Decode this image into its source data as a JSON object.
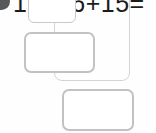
{
  "page": {
    "title": "17+16+15=",
    "background_color": "#fefefe"
  },
  "marker": {
    "name": "bullet-marker",
    "icon": "filled-circle-icon",
    "color": "#585858"
  },
  "equation": {
    "text": "17+16+15=",
    "operands": [
      17,
      16,
      15
    ],
    "operator": "+",
    "equals_sign": "=",
    "text_color": "#1c1c1c"
  },
  "answer_boxes": [
    {
      "id": "answer-box-1",
      "value": "",
      "placeholder": "",
      "border_color": "#c9c9c9",
      "fill_color": "#ffffff"
    },
    {
      "id": "answer-box-2",
      "value": "",
      "placeholder": "",
      "border_color": "#c2c2c2",
      "fill_color": "#ffffff"
    },
    {
      "id": "answer-box-3",
      "value": "",
      "placeholder": "",
      "border_color": "#c2c2c2",
      "fill_color": "#ffffff"
    }
  ],
  "group_frame": {
    "id": "group-frame",
    "border_color": "#d4d4d4"
  }
}
